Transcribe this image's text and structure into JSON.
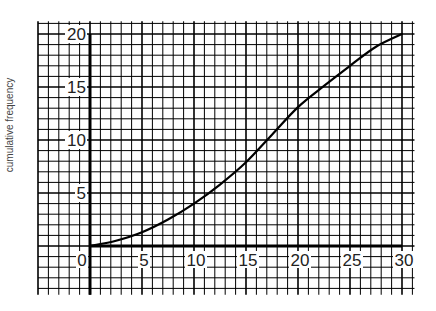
{
  "chart_data": {
    "type": "line",
    "title": "",
    "xlabel": "",
    "ylabel": "cumulative frequency",
    "xlim": [
      0,
      30
    ],
    "ylim": [
      0,
      20
    ],
    "grid": true,
    "grid_minor_step": 1,
    "grid_major_step": 5,
    "x_ticks": [
      "0",
      "5",
      "10",
      "15",
      "20",
      "25",
      "30"
    ],
    "y_ticks": [
      "5",
      "10",
      "15",
      "20"
    ],
    "legend": null,
    "series": [
      {
        "name": "cumulative frequency",
        "x": [
          0,
          2.5,
          5,
          7.5,
          10,
          12.5,
          15,
          17.5,
          20,
          22.5,
          25,
          27.5,
          30
        ],
        "values": [
          0,
          0.5,
          1.3,
          2.5,
          4,
          5.8,
          7.9,
          10.5,
          13.1,
          15.1,
          17,
          18.8,
          20
        ]
      }
    ]
  },
  "labels": {
    "ylabel": "cumulative frequency"
  }
}
